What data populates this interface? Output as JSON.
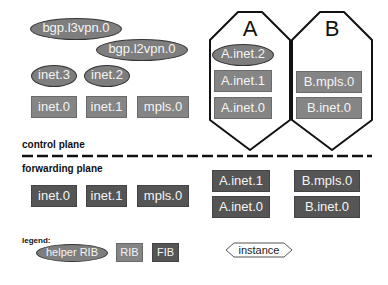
{
  "control_plane": {
    "helper_ribs": [
      "bgp.l3vpn.0",
      "bgp.l2vpn.0",
      "inet.3",
      "inet.2"
    ],
    "ribs": [
      "inet.0",
      "inet.1",
      "mpls.0"
    ],
    "instances": [
      {
        "name": "A",
        "helper_ribs": [
          "A.inet.2"
        ],
        "ribs": [
          "A.inet.1",
          "A.inet.0"
        ]
      },
      {
        "name": "B",
        "helper_ribs": [],
        "ribs": [
          "B.mpls.0",
          "B.inet.0"
        ]
      }
    ]
  },
  "labels": {
    "control_plane": "control plane",
    "forwarding_plane": "forwarding plane",
    "legend": "legend:"
  },
  "forwarding_plane": {
    "fibs": [
      "inet.0",
      "inet.1",
      "mpls.0"
    ],
    "instance_a": [
      "A.inet.1",
      "A.inet.0"
    ],
    "instance_b": [
      "B.mpls.0",
      "B.inet.0"
    ]
  },
  "legend": {
    "helper": "helper RIB",
    "rib": "RIB",
    "fib": "FIB",
    "instance": "instance"
  },
  "colors": {
    "helper": "#7e7e7e",
    "rib": "#858585",
    "fib": "#555555",
    "outline": "#111111"
  }
}
